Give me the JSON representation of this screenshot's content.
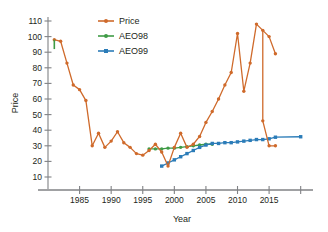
{
  "chart_data": {
    "type": "line",
    "title": "",
    "xlabel": "Year",
    "ylabel": "Price",
    "xlim": [
      1980,
      2021
    ],
    "ylim": [
      5,
      113
    ],
    "grid": false,
    "legend_position": "top-left",
    "xticks": [
      1985,
      1990,
      1995,
      2000,
      2005,
      2010,
      2015,
      2020
    ],
    "xticklabels": [
      "1985",
      "1990",
      "1995",
      "2000",
      "2005",
      "2010",
      "2015",
      ""
    ],
    "yticks": [
      10,
      20,
      30,
      40,
      50,
      60,
      70,
      80,
      90,
      100,
      110
    ],
    "yticklabels": [
      "10",
      "20",
      "30",
      "40",
      "50",
      "60",
      "70",
      "80",
      "90",
      "100",
      "110"
    ],
    "series": [
      {
        "name": "Price",
        "color": "#cf6a2b",
        "marker": "circle",
        "x": [
          1981,
          1982,
          1983,
          1984,
          1985,
          1986,
          1987,
          1988,
          1989,
          1990,
          1991,
          1992,
          1993,
          1994,
          1995,
          1996,
          1997,
          1998,
          1999,
          2000,
          2001,
          2002,
          2003,
          2004,
          2005,
          2006,
          2007,
          2008,
          2009,
          2010,
          2011,
          2012,
          2013,
          2014,
          2015,
          2016
        ],
        "values": [
          98,
          97,
          83,
          69,
          66,
          59,
          30,
          38,
          29,
          33,
          39,
          32,
          29,
          25,
          24,
          27,
          31,
          26,
          17,
          29,
          38,
          29,
          31,
          36,
          45,
          52,
          60,
          69,
          77,
          102,
          65,
          83,
          108,
          104,
          100,
          89
        ]
      },
      {
        "name": "AEO98",
        "color": "#3f9b46",
        "marker": "circle",
        "x": [
          1996,
          1997,
          1998,
          1999,
          2000,
          2001,
          2002,
          2003,
          2004,
          2005,
          2006
        ],
        "values": [
          28,
          28,
          28,
          28.5,
          28.5,
          29,
          29.5,
          30,
          30.5,
          31,
          31
        ]
      },
      {
        "name": "AEO99",
        "color": "#2b7cb8",
        "marker": "square",
        "x": [
          1998,
          1999,
          2000,
          2001,
          2002,
          2003,
          2004,
          2005,
          2006,
          2007,
          2008,
          2009,
          2010,
          2011,
          2012,
          2013,
          2014,
          2015,
          2016,
          2020
        ],
        "values": [
          17,
          19,
          21,
          23,
          25,
          27,
          29,
          30.5,
          31.5,
          31.5,
          32,
          32,
          32.5,
          33,
          33.5,
          34,
          34,
          34.5,
          35.5,
          35.8
        ]
      }
    ],
    "price_tail": {
      "x": [
        2014,
        2015,
        2016
      ],
      "values": [
        46,
        30,
        30
      ]
    }
  },
  "legend": {
    "items": [
      {
        "label": "Price",
        "color": "#cf6a2b"
      },
      {
        "label": "AEO98",
        "color": "#3f9b46"
      },
      {
        "label": "AEO99",
        "color": "#2b7cb8"
      }
    ]
  },
  "axes": {
    "x_title": "Year",
    "y_title": "Price"
  }
}
